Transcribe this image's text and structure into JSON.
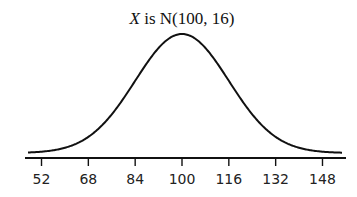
{
  "chart_data": {
    "type": "line",
    "title": "X is N(100, 16)",
    "title_parts": {
      "variable": "X",
      "rest": " is N(100, 16)"
    },
    "xlabel": "",
    "ylabel": "",
    "distribution": {
      "name": "normal",
      "mean": 100,
      "sd": 16
    },
    "x_ticks": [
      52,
      68,
      84,
      100,
      116,
      132,
      148
    ],
    "xlim": [
      44,
      153
    ],
    "grid": false,
    "legend": "none",
    "curve_color": "#111111",
    "axis_color": "#111111"
  }
}
